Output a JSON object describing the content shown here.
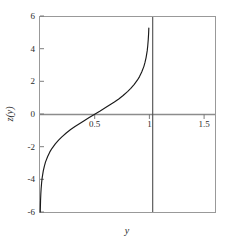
{
  "chart_data": {
    "type": "line",
    "title": "",
    "xlabel": "y",
    "ylabel": "z(y)",
    "xlim": [
      0.0,
      1.6
    ],
    "ylim": [
      -6,
      6
    ],
    "grid": false,
    "legend": null,
    "xticks": [
      0.5,
      1,
      1.5
    ],
    "xtick_labels": [
      "0.5",
      "1",
      "1.5"
    ],
    "yticks": [
      -6,
      -4,
      -2,
      0,
      2,
      4,
      6
    ],
    "ytick_labels": [
      "-6",
      "-4",
      "-2",
      "0",
      "2",
      "4",
      "6"
    ],
    "series": [
      {
        "name": "z(y) = ln(y/(1-y))",
        "color": "#1a1a1a",
        "x": [
          0.0025,
          0.005,
          0.0075,
          0.01,
          0.015,
          0.02,
          0.03,
          0.04,
          0.05,
          0.07,
          0.09,
          0.11,
          0.14,
          0.17,
          0.2,
          0.24,
          0.28,
          0.32,
          0.36,
          0.4,
          0.45,
          0.5,
          0.55,
          0.6,
          0.64,
          0.68,
          0.72,
          0.76,
          0.8,
          0.83,
          0.86,
          0.89,
          0.91,
          0.93,
          0.95,
          0.96,
          0.97,
          0.98,
          0.985,
          0.99,
          0.993,
          0.995
        ],
        "y": [
          -5.99,
          -5.29,
          -4.89,
          -4.6,
          -4.19,
          -3.89,
          -3.48,
          -3.18,
          -2.94,
          -2.59,
          -2.31,
          -2.09,
          -1.82,
          -1.59,
          -1.39,
          -1.15,
          -0.94,
          -0.75,
          -0.58,
          -0.41,
          -0.2,
          0.0,
          0.2,
          0.41,
          0.58,
          0.75,
          0.94,
          1.15,
          1.39,
          1.59,
          1.82,
          2.09,
          2.31,
          2.59,
          2.94,
          3.18,
          3.48,
          3.89,
          4.19,
          4.6,
          4.96,
          5.29
        ]
      }
    ],
    "reference_lines": [
      {
        "name": "zero-line",
        "orientation": "horizontal",
        "value": 0,
        "color": "#8c8c8c"
      },
      {
        "name": "asymptote-line",
        "orientation": "vertical",
        "value": 1.03,
        "color": "#4d4d4d"
      }
    ],
    "frame_color": "#999999",
    "background_color": "#ffffff"
  },
  "axes": {
    "y_title": "z(y)",
    "x_title": "y"
  }
}
